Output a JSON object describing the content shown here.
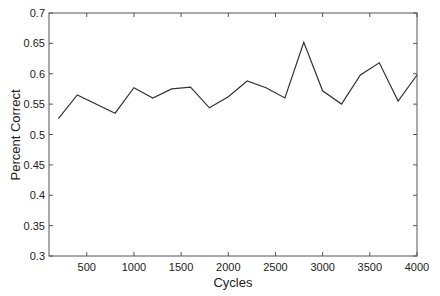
{
  "chart_data": {
    "type": "line",
    "title": "",
    "xlabel": "Cycles",
    "ylabel": "Percent Correct",
    "xlim": [
      100,
      4000
    ],
    "ylim": [
      0.3,
      0.7
    ],
    "grid": false,
    "legend": null,
    "x_ticks": [
      500,
      1000,
      1500,
      2000,
      2500,
      3000,
      3500,
      4000
    ],
    "x_tick_labels": [
      "500",
      "1000",
      "1500",
      "2000",
      "2500",
      "3000",
      "3500",
      "4000"
    ],
    "y_ticks": [
      0.3,
      0.35,
      0.4,
      0.45,
      0.5,
      0.55,
      0.6,
      0.65,
      0.7
    ],
    "y_tick_labels": [
      "0.3",
      "0.35",
      "0.4",
      "0.45",
      "0.5",
      "0.55",
      "0.6",
      "0.65",
      "0.7"
    ],
    "series": [
      {
        "name": "Percent Correct",
        "color": "#333333",
        "x": [
          200,
          400,
          800,
          1000,
          1200,
          1400,
          1600,
          1800,
          2000,
          2200,
          2400,
          2600,
          2800,
          3000,
          3200,
          3400,
          3600,
          3800,
          4000
        ],
        "values": [
          0.526,
          0.565,
          0.535,
          0.577,
          0.56,
          0.575,
          0.578,
          0.544,
          0.562,
          0.588,
          0.577,
          0.56,
          0.652,
          0.572,
          0.55,
          0.598,
          0.618,
          0.555,
          0.598
        ]
      }
    ]
  }
}
